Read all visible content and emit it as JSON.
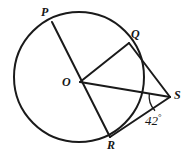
{
  "figure": {
    "type": "circle-geometry-diagram",
    "stroke_color": "#1a1a1a",
    "background_color": "#ffffff",
    "circle": {
      "center_label": "O",
      "center_x": 79,
      "center_y": 77,
      "radius": 65,
      "stroke_width": 2
    },
    "points": [
      {
        "id": "P",
        "label": "P",
        "x": 52,
        "y": 22,
        "on_circle": true
      },
      {
        "id": "Q",
        "label": "Q",
        "x": 129,
        "y": 43,
        "on_circle": true
      },
      {
        "id": "O",
        "label": "O",
        "x": 80,
        "y": 82,
        "on_circle": false
      },
      {
        "id": "R",
        "label": "R",
        "x": 110,
        "y": 137,
        "on_circle": true
      },
      {
        "id": "S",
        "label": "S",
        "x": 170,
        "y": 97,
        "on_circle": false
      }
    ],
    "segments": [
      {
        "id": "PR",
        "from": "P",
        "to": "R",
        "note": "diameter-like chord through O"
      },
      {
        "id": "OQ",
        "from": "O",
        "to": "Q",
        "note": "radius"
      },
      {
        "id": "OS",
        "from": "O",
        "to": "S",
        "note": "line from center to external point"
      },
      {
        "id": "QS",
        "from": "Q",
        "to": "S",
        "note": "tangent-like segment"
      },
      {
        "id": "RS",
        "from": "R",
        "to": "S",
        "note": "secant-like segment"
      }
    ],
    "angle": {
      "vertex": "S",
      "value": "42",
      "degree_symbol": "°",
      "label": "42°",
      "arc_radius": 21,
      "between": [
        "OS",
        "RS"
      ]
    }
  }
}
